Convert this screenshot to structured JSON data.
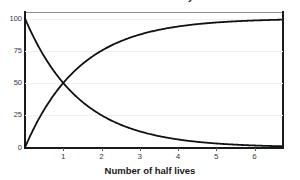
{
  "chart_data": {
    "type": "line",
    "title": "Radioactive decay",
    "xlabel": "Number of half lives",
    "ylabel": "",
    "xlim": [
      0,
      6.72
    ],
    "ylim": [
      0,
      105
    ],
    "grid": true,
    "legend": "none",
    "x_ticks": [
      "1",
      "2",
      "3",
      "4",
      "5",
      "6"
    ],
    "x_tick_values": [
      1,
      2,
      3,
      4,
      5,
      6
    ],
    "y_ticks": [
      "0",
      "25",
      "50",
      "75",
      "100"
    ],
    "y_tick_values": [
      0,
      25,
      50,
      75,
      100
    ],
    "series": [
      {
        "name": "Parent nuclide remaining",
        "color": "#111111",
        "formula": "100 * 2^(-x)",
        "x": [
          0,
          0.25,
          0.5,
          0.75,
          1,
          1.5,
          2,
          2.5,
          3,
          3.5,
          4,
          4.5,
          5,
          5.5,
          6,
          6.5,
          6.72
        ],
        "values": [
          100,
          84.1,
          70.7,
          59.5,
          50,
          35.4,
          25,
          17.7,
          12.5,
          8.8,
          6.3,
          4.4,
          3.1,
          2.2,
          1.6,
          1.1,
          0.95
        ]
      },
      {
        "name": "Daughter nuclide produced",
        "color": "#111111",
        "formula": "100 * (1 - 2^(-x))",
        "x": [
          0,
          0.25,
          0.5,
          0.75,
          1,
          1.5,
          2,
          2.5,
          3,
          3.5,
          4,
          4.5,
          5,
          5.5,
          6,
          6.5,
          6.72
        ],
        "values": [
          0,
          15.9,
          29.3,
          40.5,
          50,
          64.6,
          75,
          82.3,
          87.5,
          91.2,
          93.8,
          95.6,
          96.9,
          97.8,
          98.4,
          98.9,
          99.05
        ]
      }
    ],
    "annotations": [
      {
        "text": "curves cross at (1, 50)",
        "x": 1,
        "y": 50
      }
    ]
  },
  "colors": {
    "curve": "#111111",
    "axis": "#1a1a1a",
    "axis_top": "#8c8c8c",
    "grid": "#f0f0f2",
    "tick_text": "#3a3a3a",
    "label_text": "#1a1a1a",
    "background": "#ffffff"
  }
}
